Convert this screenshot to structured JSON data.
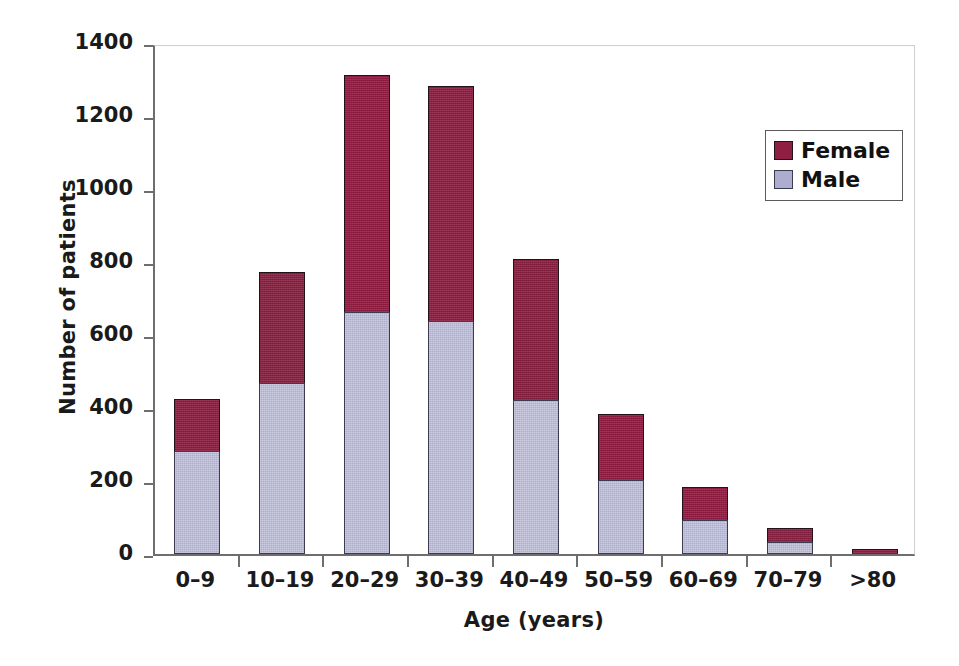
{
  "chart_data": {
    "type": "bar",
    "subtype": "stacked-vertical",
    "title": "",
    "xlabel": "Age (years)",
    "ylabel": "Number of patients",
    "categories": [
      "0–9",
      "10–19",
      "20–29",
      "30–39",
      "40–49",
      "50–59",
      "60–69",
      "70–79",
      ">80"
    ],
    "series": [
      {
        "name": "Male",
        "color": "#ADAECE",
        "values": [
          282,
          468,
          662,
          638,
          423,
          202,
          94,
          34,
          0
        ]
      },
      {
        "name": "Female",
        "color": "#8E1F42",
        "values": [
          143,
          305,
          650,
          645,
          385,
          183,
          89,
          38,
          13
        ]
      }
    ],
    "totals": [
      425,
      773,
      1312,
      1283,
      808,
      385,
      183,
      72,
      13
    ],
    "ylim": [
      0,
      1400
    ],
    "yticks": [
      0,
      200,
      400,
      600,
      800,
      1000,
      1200,
      1400
    ],
    "ytick_labels": [
      "0",
      "200",
      "400",
      "600",
      "800",
      "1000",
      "1200",
      "1400"
    ],
    "grid": false,
    "legend_position": "top-right",
    "legend_entries": [
      "Female",
      "Male"
    ],
    "stack_order_bottom_to_top": [
      "Male",
      "Female"
    ]
  },
  "legend": {
    "items": [
      {
        "label": "Female",
        "swatch": "female"
      },
      {
        "label": "Male",
        "swatch": "male"
      }
    ]
  },
  "axes": {
    "y_title": "Number of patients",
    "x_title": "Age (years)"
  }
}
